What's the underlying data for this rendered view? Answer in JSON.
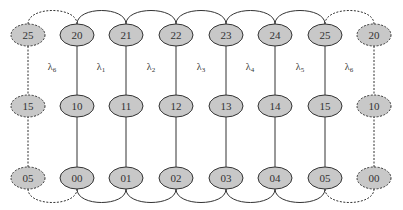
{
  "diagram": {
    "title": "",
    "colors": {
      "node_fill": "#c8c8c8",
      "node_stroke": "#333333",
      "edge": "#333333",
      "background": "#ffffff"
    },
    "columns": [
      {
        "x": 28,
        "style": "dashed",
        "nodes": [
          "25",
          "15",
          "05"
        ]
      },
      {
        "x": 77,
        "style": "solid",
        "nodes": [
          "20",
          "10",
          "00"
        ]
      },
      {
        "x": 126,
        "style": "solid",
        "nodes": [
          "21",
          "11",
          "01"
        ]
      },
      {
        "x": 176,
        "style": "solid",
        "nodes": [
          "22",
          "12",
          "02"
        ]
      },
      {
        "x": 226,
        "style": "solid",
        "nodes": [
          "23",
          "13",
          "03"
        ]
      },
      {
        "x": 275,
        "style": "solid",
        "nodes": [
          "24",
          "14",
          "04"
        ]
      },
      {
        "x": 325,
        "style": "solid",
        "nodes": [
          "25",
          "15",
          "05"
        ]
      },
      {
        "x": 374,
        "style": "dashed",
        "nodes": [
          "20",
          "10",
          "00"
        ]
      }
    ],
    "rows_y": [
      35,
      106,
      178
    ],
    "lambdas": [
      {
        "symbol": "λ",
        "sub": "6",
        "x": 52
      },
      {
        "symbol": "λ",
        "sub": "1",
        "x": 101
      },
      {
        "symbol": "λ",
        "sub": "2",
        "x": 151
      },
      {
        "symbol": "λ",
        "sub": "3",
        "x": 201
      },
      {
        "symbol": "λ",
        "sub": "4",
        "x": 250
      },
      {
        "symbol": "λ",
        "sub": "5",
        "x": 300
      },
      {
        "symbol": "λ",
        "sub": "6",
        "x": 349
      }
    ],
    "lambda_y": 70
  }
}
